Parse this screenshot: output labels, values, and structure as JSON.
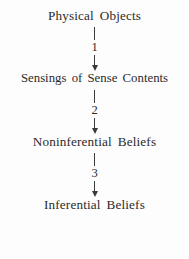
{
  "diagram": {
    "type": "vertical-flow-chain",
    "background_color": "#fdfdfd",
    "text_color": "#2b2b2b",
    "nodes": [
      {
        "label": "Physical Objects"
      },
      {
        "label": "Sensings of Sense Contents"
      },
      {
        "label": "Noninferential Beliefs"
      },
      {
        "label": "Inferential Beliefs"
      }
    ],
    "connectors": [
      {
        "number": "1",
        "arrow": "down-arrow-icon"
      },
      {
        "number": "2",
        "arrow": "down-arrow-icon"
      },
      {
        "number": "3",
        "arrow": "down-arrow-icon"
      }
    ]
  }
}
